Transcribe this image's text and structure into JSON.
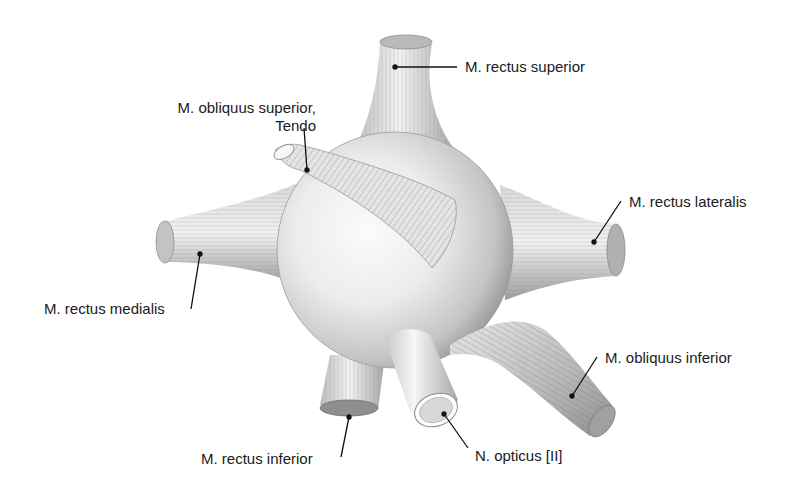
{
  "figure": {
    "colors": {
      "background": "#ffffff",
      "globe_light": "#f4f4f4",
      "globe_mid": "#d6d6d6",
      "globe_dark": "#9a9a9a",
      "muscle_light": "#eeeeee",
      "muscle_dark": "#8c8c8c",
      "leader_line": "#111111",
      "label_text": "#1a1a1a"
    }
  },
  "labels": {
    "rectus_superior": "M. rectus superior",
    "obliquus_superior_line1": "M. obliquus superior,",
    "obliquus_superior_line2": "Tendo",
    "rectus_lateralis": "M. rectus lateralis",
    "rectus_medialis": "M. rectus medialis",
    "obliquus_inferior": "M. obliquus inferior",
    "rectus_inferior": "M. rectus inferior",
    "opticus": "N. opticus [II]"
  }
}
